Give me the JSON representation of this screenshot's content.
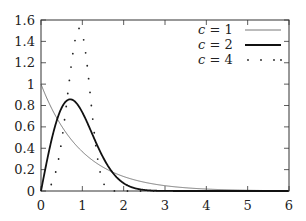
{
  "chart_data": {
    "type": "line",
    "title": "",
    "xlabel": "",
    "ylabel": "",
    "xlim": [
      0,
      6
    ],
    "ylim": [
      0,
      1.6
    ],
    "grid": false,
    "legend_position": "upper right",
    "x_ticks": [
      "0",
      "1",
      "2",
      "3",
      "4",
      "5",
      "6"
    ],
    "y_ticks": [
      "0",
      "0.2",
      "0.4",
      "0.6",
      "0.8",
      "1",
      "1.2",
      "1.4",
      "1.6"
    ],
    "function": "c * x^(c-1) * exp(-x^c)",
    "series": [
      {
        "name": "c = 1",
        "c": 1,
        "style": "thin-solid",
        "x": [
          0,
          0.5,
          1,
          1.5,
          2,
          3,
          4,
          5,
          6
        ],
        "values": [
          1.0,
          0.61,
          0.37,
          0.22,
          0.14,
          0.05,
          0.02,
          0.01,
          0.0
        ]
      },
      {
        "name": "c = 2",
        "c": 2,
        "style": "thick-solid",
        "x": [
          0,
          0.25,
          0.5,
          0.707,
          1,
          1.5,
          2,
          2.5,
          3
        ],
        "values": [
          0.0,
          0.47,
          0.78,
          0.86,
          0.74,
          0.32,
          0.07,
          0.01,
          0.0
        ]
      },
      {
        "name": "c = 4",
        "c": 4,
        "style": "dotted",
        "x": [
          0,
          0.25,
          0.5,
          0.75,
          0.93,
          1,
          1.25,
          1.5,
          1.75
        ],
        "values": [
          0.0,
          0.06,
          0.47,
          1.22,
          1.48,
          1.47,
          0.71,
          0.08,
          0.0
        ]
      }
    ]
  },
  "legend": {
    "items": [
      {
        "var": "c",
        "eq": " = 1"
      },
      {
        "var": "c",
        "eq": " = 2"
      },
      {
        "var": "c",
        "eq": " = 4"
      }
    ]
  }
}
